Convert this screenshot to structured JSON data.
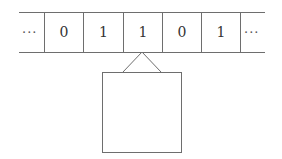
{
  "diagram": {
    "type": "turing-machine-tape",
    "tape": {
      "left_ellipsis": "···",
      "cells": [
        "0",
        "1",
        "1",
        "0",
        "1"
      ],
      "right_ellipsis": "···",
      "head_position_index": 2
    },
    "head": {
      "shape": "box-with-triangle-pointer",
      "label": ""
    },
    "colors": {
      "stroke": "#6e6e6e",
      "text": "#333333",
      "background": "#ffffff"
    }
  }
}
